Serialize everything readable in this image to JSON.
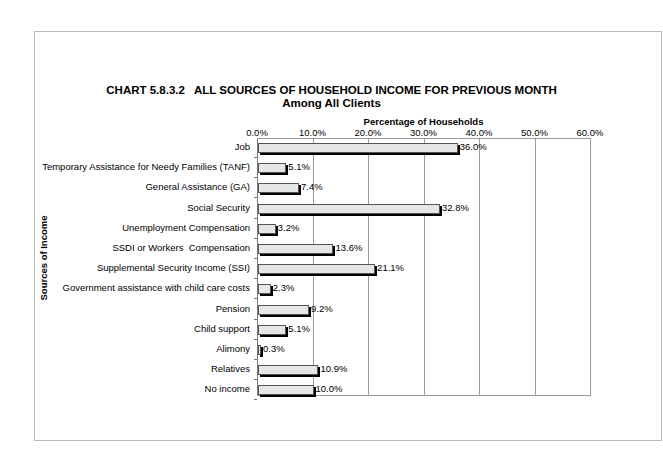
{
  "chart_data": {
    "type": "bar",
    "orientation": "horizontal",
    "title": "CHART 5.8.3.2   ALL SOURCES OF HOUSEHOLD INCOME FOR PREVIOUS MONTH",
    "subtitle": "Among All Clients",
    "xlabel": "Percentage of Households",
    "ylabel": "Sources of Income",
    "xlim": [
      0,
      60
    ],
    "x_ticks": [
      "0.0%",
      "10.0%",
      "20.0%",
      "30.0%",
      "40.0%",
      "50.0%",
      "60.0%"
    ],
    "grid": true,
    "legend": "none",
    "categories": [
      "Job",
      "Temporary Assistance for Needy Families (TANF)",
      "General Assistance (GA)",
      "Social Security",
      "Unemployment Compensation",
      "SSDI or Workers  Compensation",
      "Supplemental Security Income (SSI)",
      "Government assistance with child care costs",
      "Pension",
      "Child support",
      "Alimony",
      "Relatives",
      "No income"
    ],
    "values": [
      36.0,
      5.1,
      7.4,
      32.8,
      3.2,
      13.6,
      21.1,
      2.3,
      9.2,
      5.1,
      0.3,
      10.9,
      10.0
    ],
    "value_labels": [
      "36.0%",
      "5.1%",
      "7.4%",
      "32.8%",
      "3.2%",
      "13.6%",
      "21.1%",
      "2.3%",
      "9.2%",
      "5.1%",
      "0.3%",
      "10.9%",
      "10.0%"
    ],
    "colors": {
      "bar_fill": "#e6e6e6",
      "bar_border": "#555555",
      "bar_shadow": "#000000",
      "grid": "#9a9a9a",
      "frame": "#b8b8b8"
    }
  }
}
